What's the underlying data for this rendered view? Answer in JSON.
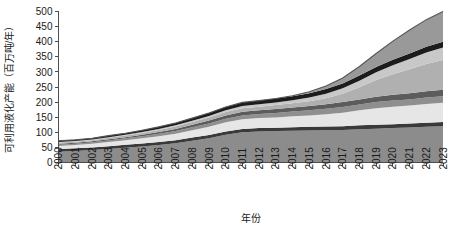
{
  "chart_data": {
    "type": "area",
    "stacked": true,
    "title": "",
    "xlabel": "年份",
    "ylabel": "可利用液化产能（百万吨/年）",
    "xlim": [
      2000,
      2023
    ],
    "ylim": [
      0,
      500
    ],
    "yticks": [
      0,
      50,
      100,
      150,
      200,
      250,
      300,
      350,
      400,
      450,
      500
    ],
    "ytick_labels": [
      "0",
      "50",
      "100",
      "150",
      "200",
      "250",
      "300",
      "350",
      "400",
      "450",
      "500"
    ],
    "grid": false,
    "legend": "none",
    "categories": [
      "2000",
      "2001",
      "2002",
      "2003",
      "2004",
      "2005",
      "2006",
      "2007",
      "2008",
      "2009",
      "2010",
      "2011",
      "2012",
      "2013",
      "2014",
      "2015",
      "2016",
      "2017",
      "2018",
      "2019",
      "2020",
      "2021",
      "2022",
      "2023"
    ],
    "series": [
      {
        "name": "中东",
        "color": "#8c8c8c",
        "values": [
          36,
          38,
          41,
          45,
          49,
          53,
          58,
          64,
          72,
          80,
          92,
          100,
          103,
          104,
          105,
          106,
          107,
          108,
          110,
          112,
          114,
          116,
          118,
          120
        ]
      },
      {
        "name": "东南亚",
        "color": "#3a3a3a",
        "values": [
          9,
          9,
          9,
          9,
          10,
          10,
          10,
          10,
          11,
          11,
          11,
          11,
          11,
          11,
          12,
          12,
          12,
          12,
          13,
          13,
          13,
          13,
          14,
          14
        ]
      },
      {
        "name": "非洲",
        "color": "#e6e6e6",
        "values": [
          10,
          11,
          12,
          14,
          15,
          17,
          19,
          21,
          24,
          27,
          30,
          32,
          33,
          34,
          36,
          38,
          41,
          45,
          50,
          55,
          58,
          60,
          62,
          64
        ]
      },
      {
        "name": "澳大利亚",
        "color": "#8f8f8f",
        "values": [
          4,
          4,
          5,
          5,
          6,
          7,
          8,
          9,
          10,
          11,
          12,
          13,
          14,
          15,
          16,
          17,
          18,
          19,
          19,
          20,
          20,
          20,
          21,
          21
        ]
      },
      {
        "name": "俄罗斯",
        "color": "#5c5c5c",
        "values": [
          3,
          3,
          3,
          4,
          4,
          5,
          6,
          7,
          8,
          10,
          11,
          12,
          12,
          13,
          13,
          14,
          15,
          16,
          17,
          18,
          19,
          20,
          21,
          22
        ]
      },
      {
        "name": "北美",
        "color": "#b0b0b0",
        "values": [
          4,
          4,
          4,
          5,
          5,
          6,
          7,
          8,
          9,
          10,
          11,
          12,
          12,
          13,
          14,
          16,
          20,
          28,
          40,
          55,
          68,
          80,
          90,
          98
        ]
      },
      {
        "name": "其他",
        "color": "#c8c8c8",
        "values": [
          2,
          2,
          2,
          2,
          3,
          3,
          3,
          4,
          4,
          5,
          6,
          7,
          8,
          9,
          10,
          12,
          15,
          18,
          22,
          26,
          30,
          34,
          38,
          42
        ]
      },
      {
        "name": "在建产能",
        "color": "#1c1c1c",
        "values": [
          4,
          4,
          4,
          5,
          5,
          6,
          7,
          8,
          9,
          10,
          11,
          12,
          12,
          13,
          13,
          14,
          15,
          16,
          17,
          17,
          18,
          18,
          19,
          19
        ]
      },
      {
        "name": "规划产能",
        "color": "#999999",
        "values": [
          0,
          0,
          0,
          0,
          0,
          0,
          0,
          0,
          0,
          0,
          0,
          0,
          0,
          0,
          2,
          5,
          10,
          18,
          30,
          45,
          62,
          78,
          90,
          100
        ]
      }
    ]
  }
}
